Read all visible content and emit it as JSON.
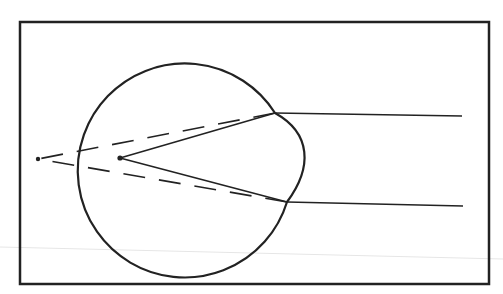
{
  "diagram": {
    "title": "",
    "colors": {
      "ink": "#222222",
      "background": "#ffffff",
      "scanline": "#e2e2e2"
    },
    "frame": {
      "x": 20,
      "y": 22,
      "width": 469,
      "height": 262
    },
    "eyeball": {
      "cx": 185,
      "cy": 172,
      "r": 107
    },
    "cornea": {
      "top": [
        275,
        113
      ],
      "bottom": [
        287,
        202
      ],
      "bulge_x": 311
    },
    "focal_point_inside": [
      120,
      158
    ],
    "virtual_image_point": [
      38,
      159
    ],
    "incoming_rays": [
      {
        "from": [
          462,
          116
        ],
        "to": [
          275,
          113
        ]
      },
      {
        "from": [
          463,
          206
        ],
        "to": [
          287,
          202
        ]
      }
    ],
    "refracted_rays": [
      {
        "from": [
          275,
          113
        ],
        "to": [
          120,
          158
        ]
      },
      {
        "from": [
          287,
          202
        ],
        "to": [
          120,
          158
        ]
      }
    ],
    "dashed_extensions": [
      {
        "from": [
          275,
          113
        ],
        "to": [
          38,
          159
        ]
      },
      {
        "from": [
          287,
          202
        ],
        "to": [
          38,
          159
        ]
      }
    ]
  }
}
